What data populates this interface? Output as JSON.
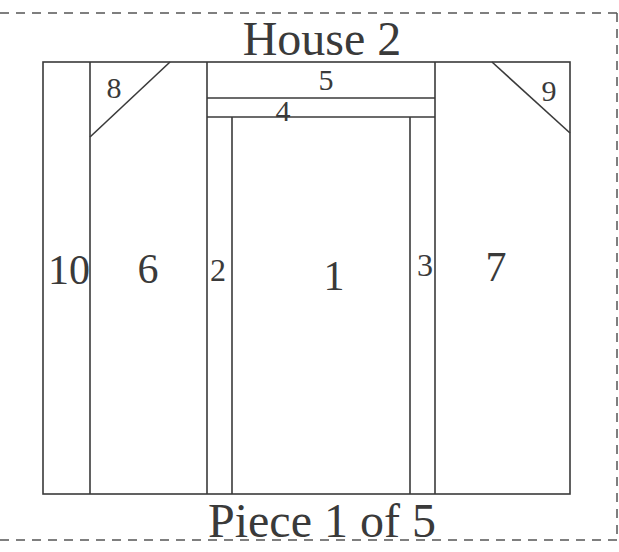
{
  "title": "House 2",
  "footer": "Piece 1 of 5",
  "colors": {
    "line": "#3a3a3a",
    "text": "#3a3a3a",
    "dash": "#555555",
    "background": "#ffffff"
  },
  "pieces": [
    {
      "id": "1",
      "label": "1"
    },
    {
      "id": "2",
      "label": "2"
    },
    {
      "id": "3",
      "label": "3"
    },
    {
      "id": "4",
      "label": "4"
    },
    {
      "id": "5",
      "label": "5"
    },
    {
      "id": "6",
      "label": "6"
    },
    {
      "id": "7",
      "label": "7"
    },
    {
      "id": "8",
      "label": "8"
    },
    {
      "id": "9",
      "label": "9"
    },
    {
      "id": "10",
      "label": "10"
    }
  ]
}
